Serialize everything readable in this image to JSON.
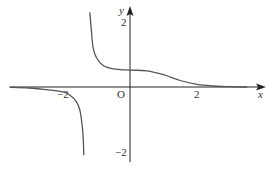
{
  "chart_data": {
    "type": "line",
    "title": "",
    "xlabel": "x",
    "ylabel": "y",
    "origin_label": "O",
    "x_ticks": [
      {
        "value": -2,
        "label": "−2"
      },
      {
        "value": 2,
        "label": "2"
      }
    ],
    "y_ticks": [
      {
        "value": 2,
        "label": "2"
      },
      {
        "value": -2,
        "label": "−2"
      }
    ],
    "xlim": [
      -3.6,
      4.3
    ],
    "ylim": [
      -2.3,
      2.5
    ],
    "grid": false,
    "legend": null,
    "vertical_asymptote": -1.2,
    "horizontal_asymptote": 0,
    "series": [
      {
        "name": "left branch",
        "color": "#555555",
        "points": [
          [
            -3.6,
            -0.01
          ],
          [
            -3.0,
            -0.03
          ],
          [
            -2.5,
            -0.08
          ],
          [
            -2.0,
            -0.15
          ],
          [
            -1.8,
            -0.25
          ],
          [
            -1.6,
            -0.45
          ],
          [
            -1.5,
            -0.7
          ],
          [
            -1.45,
            -1.0
          ],
          [
            -1.4,
            -1.5
          ],
          [
            -1.38,
            -2.1
          ]
        ]
      },
      {
        "name": "right branch",
        "color": "#555555",
        "points": [
          [
            -1.2,
            2.3
          ],
          [
            -1.15,
            1.7
          ],
          [
            -1.1,
            1.2
          ],
          [
            -1.0,
            0.9
          ],
          [
            -0.8,
            0.66
          ],
          [
            -0.5,
            0.56
          ],
          [
            0.0,
            0.52
          ],
          [
            0.5,
            0.5
          ],
          [
            1.0,
            0.38
          ],
          [
            1.5,
            0.2
          ],
          [
            2.0,
            0.08
          ],
          [
            2.5,
            0.03
          ],
          [
            3.0,
            0.01
          ],
          [
            3.5,
            0.0
          ]
        ]
      }
    ]
  }
}
